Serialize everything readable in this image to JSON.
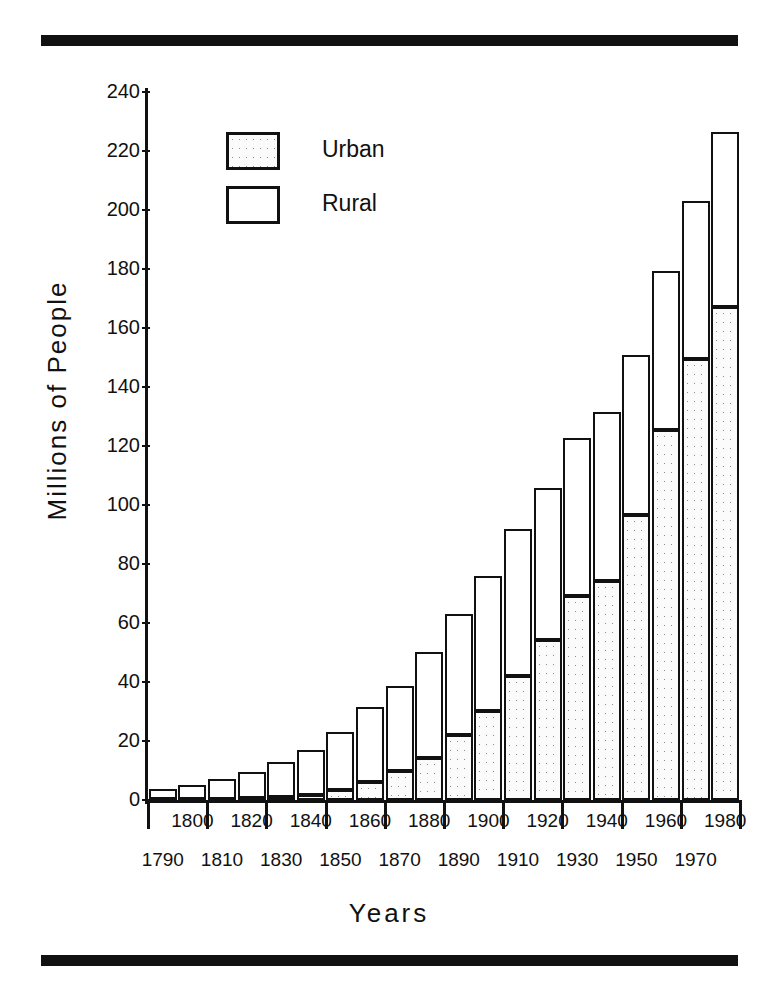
{
  "figure": {
    "rules": {
      "top": "top-rule",
      "bottom": "bottom-rule"
    }
  },
  "legend": {
    "position": "upper-left-inside",
    "items": [
      {
        "label": "Urban",
        "swatch": "stippled"
      },
      {
        "label": "Rural",
        "swatch": "white"
      }
    ]
  },
  "chart_data": {
    "type": "bar",
    "stacked": true,
    "title": "",
    "xlabel": "Years",
    "ylabel": "Millions of People",
    "ylim": [
      0,
      240
    ],
    "yticks": [
      0,
      20,
      40,
      60,
      80,
      100,
      120,
      140,
      160,
      180,
      200,
      220,
      240
    ],
    "ytick_labels": [
      "0",
      "20",
      "40",
      "60",
      "80",
      "100",
      "120",
      "140",
      "160",
      "180",
      "200",
      "220",
      "240"
    ],
    "grid": false,
    "categories": [
      "1790",
      "1800",
      "1810",
      "1820",
      "1830",
      "1840",
      "1850",
      "1860",
      "1870",
      "1880",
      "1890",
      "1900",
      "1910",
      "1920",
      "1930",
      "1940",
      "1950",
      "1960",
      "1970",
      "1980"
    ],
    "xtick_labels_row_upper": [
      "1800",
      "1820",
      "1840",
      "1860",
      "1880",
      "1900",
      "1920",
      "1940",
      "1960",
      "1980"
    ],
    "xtick_labels_row_lower": [
      "1790",
      "1810",
      "1830",
      "1850",
      "1870",
      "1890",
      "1910",
      "1930",
      "1950",
      "1970"
    ],
    "series": [
      {
        "name": "Urban",
        "values": [
          0.2,
          0.3,
          0.5,
          0.7,
          1.1,
          1.8,
          3.5,
          6.2,
          9.9,
          14.1,
          22.1,
          30.2,
          42.0,
          54.2,
          69.0,
          74.4,
          96.5,
          125.3,
          149.6,
          167.1
        ]
      },
      {
        "name": "Rural",
        "values": [
          3.7,
          4.9,
          6.7,
          8.9,
          11.7,
          15.2,
          19.6,
          25.2,
          28.7,
          36.0,
          40.8,
          45.8,
          50.0,
          51.6,
          53.8,
          57.2,
          54.2,
          54.1,
          53.6,
          59.5
        ]
      }
    ],
    "totals": [
      3.9,
      5.2,
      7.2,
      9.6,
      12.8,
      17.0,
      23.1,
      31.4,
      38.6,
      50.1,
      62.9,
      76.0,
      92.0,
      105.8,
      122.8,
      131.6,
      150.7,
      179.4,
      203.2,
      226.6
    ]
  }
}
